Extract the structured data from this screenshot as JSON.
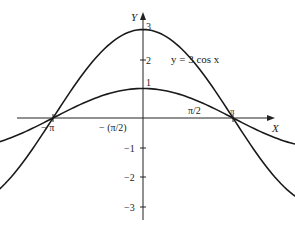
{
  "chart_data": {
    "type": "line",
    "title": "",
    "xlabel": "X",
    "ylabel": "Y",
    "x_ticks": [
      {
        "value": -3.14159,
        "label": "−π"
      },
      {
        "value": -1.5708,
        "label": "−(π/2)"
      },
      {
        "value": 1.5708,
        "label": "π/2"
      },
      {
        "value": 3.14159,
        "label": "π"
      }
    ],
    "y_ticks": [
      {
        "value": 3,
        "label": "3"
      },
      {
        "value": 2,
        "label": "2"
      },
      {
        "value": 1,
        "label": "1"
      },
      {
        "value": -1,
        "label": "−1"
      },
      {
        "value": -2,
        "label": "−2"
      },
      {
        "value": -3,
        "label": "−3"
      }
    ],
    "xlim": [
      -3.14159,
      3.14159
    ],
    "ylim": [
      -3,
      3
    ],
    "grid": false,
    "series": [
      {
        "name": "y = 3 cos x",
        "function": "3*cos(x)",
        "amplitude": 3,
        "x": [
          -3.1416,
          -2.3562,
          -1.5708,
          -0.7854,
          0,
          0.7854,
          1.5708,
          2.3562,
          3.1416
        ],
        "values": [
          -3,
          -2.12,
          0,
          2.12,
          3,
          2.12,
          0,
          -2.12,
          -3
        ]
      },
      {
        "name": "y = cos x",
        "function": "cos(x)",
        "amplitude": 1,
        "x": [
          -3.1416,
          -2.3562,
          -1.5708,
          -0.7854,
          0,
          0.7854,
          1.5708,
          2.3562,
          3.1416
        ],
        "values": [
          -1,
          -0.71,
          0,
          0.71,
          1,
          0.71,
          0,
          -0.71,
          -1
        ]
      }
    ],
    "annotations": [
      {
        "text": "y = 3 cos x",
        "near": "right of y=3cos x curve at y≈2"
      }
    ]
  },
  "labels": {
    "x_axis": "X",
    "y_axis": "Y",
    "curve_label": "y = 3 cos x",
    "tick_neg_pi": "− π",
    "tick_neg_half_pi": "− (π/2)",
    "tick_half_pi": "π/2",
    "tick_pi": "π",
    "y3": "3",
    "y2": "2",
    "y1": "1",
    "ym1": "−1",
    "ym2": "−2",
    "ym3": "−3"
  }
}
